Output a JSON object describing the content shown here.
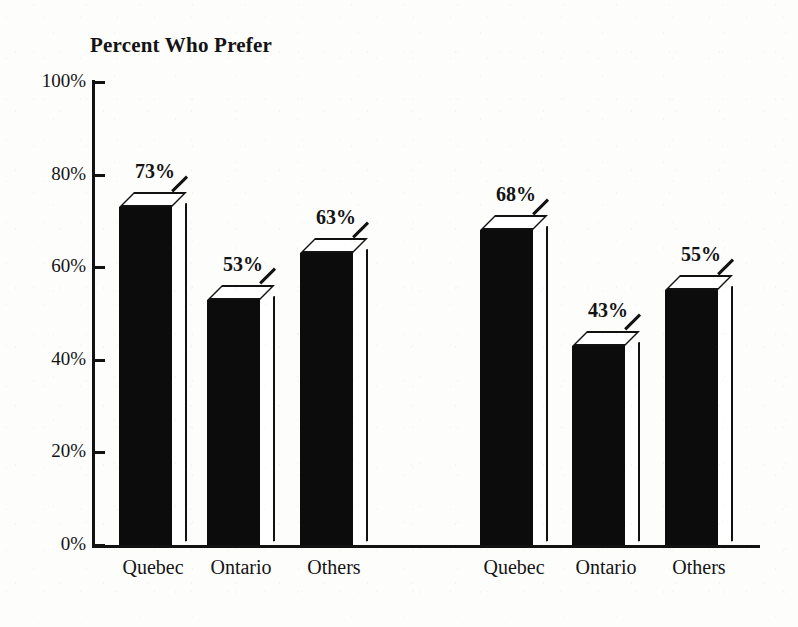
{
  "chart_data": {
    "type": "bar",
    "title": "Percent Who Prefer",
    "xlabel": "",
    "ylabel": "",
    "ylim": [
      0,
      100
    ],
    "ytick_labels": [
      "0%",
      "20%",
      "40%",
      "60%",
      "80%",
      "100%"
    ],
    "ytick_values": [
      0,
      20,
      40,
      60,
      80,
      100
    ],
    "grid": false,
    "legend": "none",
    "style": "3d-block-bars",
    "groups": [
      {
        "name": "group-1",
        "categories": [
          "Quebec",
          "Ontario",
          "Others"
        ],
        "values": [
          73,
          53,
          63
        ],
        "value_labels": [
          "73%",
          "53%",
          "63%"
        ]
      },
      {
        "name": "group-2",
        "categories": [
          "Quebec",
          "Ontario",
          "Others"
        ],
        "values": [
          68,
          43,
          55
        ],
        "value_labels": [
          "68%",
          "43%",
          "55%"
        ]
      }
    ],
    "categories": [
      "Quebec",
      "Ontario",
      "Others",
      "Quebec",
      "Ontario",
      "Others"
    ],
    "values": [
      73,
      53,
      63,
      68,
      43,
      55
    ],
    "value_labels": [
      "73%",
      "53%",
      "63%",
      "68%",
      "43%",
      "55%"
    ],
    "colors": {
      "bar_front": "#0c0c0c",
      "bar_face": "#ffffff",
      "outline": "#121212",
      "axis": "#121212",
      "text": "#141414",
      "background": "#fdfdfc"
    }
  },
  "axis": {
    "y_ticks": [
      {
        "label": "100%",
        "value": 100
      },
      {
        "label": "80%",
        "value": 80
      },
      {
        "label": "60%",
        "value": 60
      },
      {
        "label": "40%",
        "value": 40
      },
      {
        "label": "20%",
        "value": 20
      },
      {
        "label": "0%",
        "value": 0
      }
    ]
  },
  "bars": [
    {
      "label": "Quebec",
      "value": 73,
      "value_label": "73%",
      "group": 1
    },
    {
      "label": "Ontario",
      "value": 53,
      "value_label": "53%",
      "group": 1
    },
    {
      "label": "Others",
      "value": 63,
      "value_label": "63%",
      "group": 1
    },
    {
      "label": "Quebec",
      "value": 68,
      "value_label": "68%",
      "group": 2
    },
    {
      "label": "Ontario",
      "value": 43,
      "value_label": "43%",
      "group": 2
    },
    {
      "label": "Others",
      "value": 55,
      "value_label": "55%",
      "group": 2
    }
  ]
}
